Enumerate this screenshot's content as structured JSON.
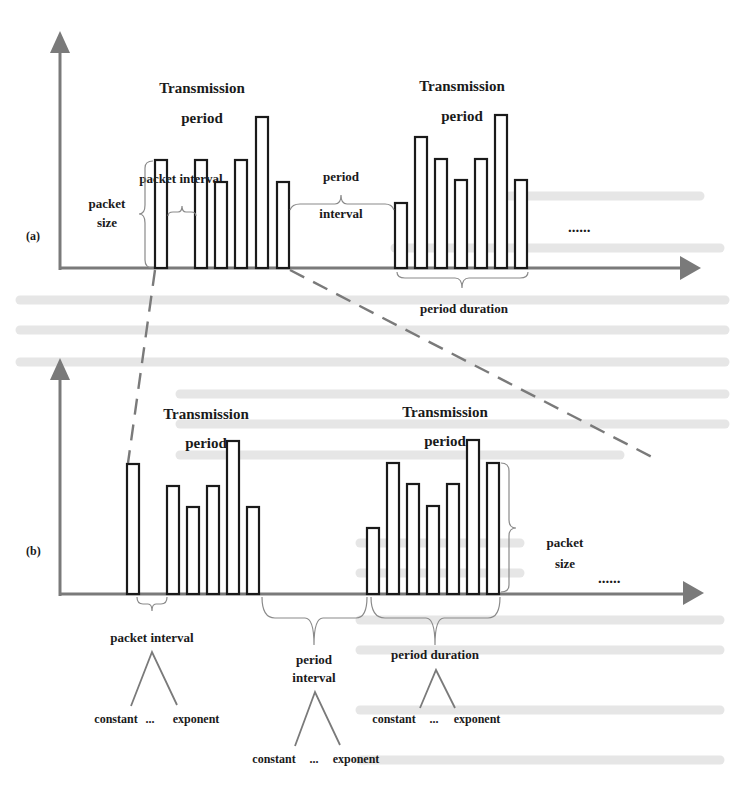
{
  "figure": {
    "panels": [
      {
        "id": "a",
        "label": "(a)",
        "periods": [
          {
            "title_line1": "Transmission",
            "title_line2": "period"
          },
          {
            "title_line1": "Transmission",
            "title_line2": "period"
          }
        ],
        "annotations": {
          "packet_interval": "packet interval",
          "packet_size_line1": "packet",
          "packet_size_line2": "size",
          "period_interval_line1": "period",
          "period_interval_line2": "interval",
          "period_duration": "period duration",
          "continuation": "......"
        },
        "bar_groups": [
          [
            {
              "x": 155,
              "top": 160
            },
            {
              "x": 195,
              "top": 160
            },
            {
              "x": 215,
              "top": 182
            },
            {
              "x": 235,
              "top": 160
            },
            {
              "x": 256,
              "top": 117
            },
            {
              "x": 277,
              "top": 182
            }
          ],
          [
            {
              "x": 395,
              "top": 203
            },
            {
              "x": 415,
              "top": 137
            },
            {
              "x": 435,
              "top": 159
            },
            {
              "x": 455,
              "top": 180
            },
            {
              "x": 475,
              "top": 159
            },
            {
              "x": 495,
              "top": 115
            },
            {
              "x": 515,
              "top": 180
            }
          ]
        ]
      },
      {
        "id": "b",
        "label": "(b)",
        "periods": [
          {
            "title_line1": "Transmission",
            "title_line2": "period"
          },
          {
            "title_line1": "Transmission",
            "title_line2": "period"
          }
        ],
        "annotations": {
          "packet_interval": "packet interval",
          "packet_size_line1": "packet",
          "packet_size_line2": "size",
          "period_interval_line1": "period",
          "period_interval_line2": "interval",
          "period_duration": "period duration",
          "continuation": "......"
        },
        "distributions": {
          "left": "constant",
          "middle": "...",
          "right": "exponent"
        },
        "bar_groups": [
          [
            {
              "x": 127,
              "top": 464
            },
            {
              "x": 167,
              "top": 486
            },
            {
              "x": 187,
              "top": 507
            },
            {
              "x": 207,
              "top": 486
            },
            {
              "x": 227,
              "top": 441
            },
            {
              "x": 247,
              "top": 507
            }
          ],
          [
            {
              "x": 367,
              "top": 528
            },
            {
              "x": 387,
              "top": 463
            },
            {
              "x": 407,
              "top": 484
            },
            {
              "x": 427,
              "top": 506
            },
            {
              "x": 447,
              "top": 484
            },
            {
              "x": 467,
              "top": 440
            },
            {
              "x": 487,
              "top": 463
            }
          ]
        ]
      }
    ],
    "colors": {
      "axis": "#7a7a7a",
      "bar_stroke": "#1a1a1a",
      "text": "#1a1a1a",
      "background": "#ffffff"
    }
  }
}
